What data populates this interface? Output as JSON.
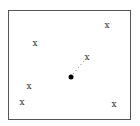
{
  "diagram": {
    "frame": {
      "left": 8,
      "top": 10,
      "width": 123,
      "height": 110
    },
    "marks": [
      {
        "label": "x",
        "x": 107,
        "y": 25
      },
      {
        "label": "x",
        "x": 35,
        "y": 43
      },
      {
        "label": "x",
        "x": 87,
        "y": 57
      },
      {
        "label": "x",
        "x": 29,
        "y": 86
      },
      {
        "label": "x",
        "x": 22,
        "y": 102
      },
      {
        "label": "x",
        "x": 114,
        "y": 104
      }
    ],
    "center_point": {
      "x": 71,
      "y": 77
    },
    "dotted_line": {
      "from": [
        71,
        77
      ],
      "to": [
        87,
        57
      ]
    }
  }
}
